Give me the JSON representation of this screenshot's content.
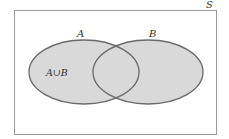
{
  "diagram": {
    "type": "venn",
    "universe_label": "S",
    "sets": [
      {
        "label": "A"
      },
      {
        "label": "B"
      }
    ],
    "region_label": "A∪B",
    "shaded": "union",
    "colors": {
      "fill": "#d9d9d9",
      "stroke": "#6a6a6a",
      "frame": "#9a9a9a",
      "text": "#333333"
    }
  }
}
